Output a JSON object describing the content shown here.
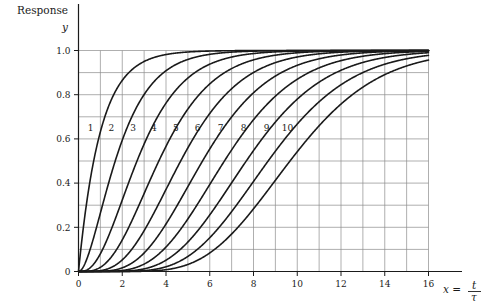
{
  "figure": {
    "y_axis_caption": "Response",
    "y_axis_symbol": "y",
    "x_axis_caption_lhs": "x =",
    "x_axis_caption_num": "t",
    "x_axis_caption_den": "τ"
  },
  "chart_data": {
    "type": "line",
    "title": "",
    "subtitle": "",
    "xlabel": "x = t/τ",
    "ylabel": "Response y",
    "xlim": [
      0,
      16
    ],
    "ylim": [
      0,
      1.04
    ],
    "grid": true,
    "grid_x_step": 1,
    "grid_y_step": 0.1,
    "legend": "inline-curve-labels",
    "legend_position": "inline",
    "xticks": [
      0,
      2,
      4,
      6,
      8,
      10,
      12,
      14,
      16
    ],
    "xtick_labels": [
      "0",
      "2",
      "4",
      "6",
      "8",
      "10",
      "12",
      "14",
      "16"
    ],
    "yticks": [
      0,
      0.2,
      0.4,
      0.6,
      0.8,
      1.0
    ],
    "ytick_labels": [
      "0",
      "0.2",
      "0.4",
      "0.6",
      "0.8",
      "1.0"
    ],
    "line_color": "#1a1a1a",
    "line_width": 1.6,
    "grid_color": "#8c8c8c",
    "axis_color": "#1a1a1a",
    "annotations": [
      {
        "text": "1",
        "x": 0.55,
        "y": 0.635
      },
      {
        "text": "2",
        "x": 1.5,
        "y": 0.635
      },
      {
        "text": "3",
        "x": 2.5,
        "y": 0.635
      },
      {
        "text": "4",
        "x": 3.45,
        "y": 0.635
      },
      {
        "text": "5",
        "x": 4.45,
        "y": 0.635
      },
      {
        "text": "6",
        "x": 5.45,
        "y": 0.635
      },
      {
        "text": "7",
        "x": 6.5,
        "y": 0.635
      },
      {
        "text": "8",
        "x": 7.55,
        "y": 0.635
      },
      {
        "text": "9",
        "x": 8.6,
        "y": 0.635
      },
      {
        "text": "10",
        "x": 9.55,
        "y": 0.635
      }
    ],
    "series": [
      {
        "name": "1",
        "order": 1,
        "formula": "y = 1 - e^{-x} * sum_{k=0}^{0} x^k/k!",
        "x": [
          0,
          0.25,
          0.5,
          0.75,
          1,
          1.5,
          2,
          2.5,
          3,
          4,
          5,
          6,
          7,
          8,
          10,
          12,
          14,
          16
        ],
        "values": [
          0,
          0.221,
          0.393,
          0.528,
          0.632,
          0.777,
          0.865,
          0.918,
          0.95,
          0.982,
          0.993,
          0.998,
          0.999,
          1.0,
          1.0,
          1.0,
          1.0,
          1.0
        ]
      },
      {
        "name": "2",
        "order": 2,
        "formula": "y = 1 - e^{-x}(1 + x)",
        "x": [
          0,
          0.5,
          1,
          1.5,
          2,
          2.5,
          3,
          4,
          5,
          6,
          7,
          8,
          10,
          12,
          14,
          16
        ],
        "values": [
          0,
          0.09,
          0.264,
          0.442,
          0.594,
          0.713,
          0.801,
          0.908,
          0.96,
          0.983,
          0.993,
          0.997,
          1.0,
          1.0,
          1.0,
          1.0
        ]
      },
      {
        "name": "3",
        "order": 3,
        "formula": "y = 1 - e^{-x}(1 + x + x^2/2)",
        "x": [
          0,
          0.5,
          1,
          1.5,
          2,
          2.5,
          3,
          4,
          5,
          6,
          7,
          8,
          10,
          12,
          14,
          16
        ],
        "values": [
          0,
          0.014,
          0.08,
          0.191,
          0.323,
          0.456,
          0.577,
          0.762,
          0.875,
          0.938,
          0.97,
          0.986,
          0.997,
          0.999,
          1.0,
          1.0
        ]
      },
      {
        "name": "4",
        "order": 4,
        "formula": "y = 1 - e^{-x} sum_{k=0}^{3} x^k/k!",
        "x": [
          0,
          1,
          1.5,
          2,
          2.5,
          3,
          3.5,
          4,
          5,
          6,
          7,
          8,
          10,
          12,
          14,
          16
        ],
        "values": [
          0,
          0.019,
          0.066,
          0.143,
          0.242,
          0.353,
          0.463,
          0.567,
          0.735,
          0.849,
          0.918,
          0.958,
          0.99,
          0.998,
          0.999,
          1.0
        ]
      },
      {
        "name": "5",
        "order": 5,
        "formula": "y = 1 - e^{-x} sum_{k=0}^{4} x^k/k!",
        "x": [
          0,
          1,
          2,
          2.5,
          3,
          3.5,
          4,
          4.5,
          5,
          6,
          7,
          8,
          10,
          12,
          14,
          16
        ],
        "values": [
          0,
          0.004,
          0.053,
          0.109,
          0.185,
          0.275,
          0.371,
          0.468,
          0.56,
          0.715,
          0.827,
          0.9,
          0.971,
          0.992,
          0.998,
          0.999
        ]
      },
      {
        "name": "6",
        "order": 6,
        "formula": "y = 1 - e^{-x} sum_{k=0}^{5} x^k/k!",
        "x": [
          0,
          1,
          2,
          3,
          3.5,
          4,
          4.5,
          5,
          5.5,
          6,
          7,
          8,
          10,
          12,
          14,
          16
        ],
        "values": [
          0,
          0.001,
          0.017,
          0.084,
          0.142,
          0.215,
          0.297,
          0.384,
          0.47,
          0.554,
          0.699,
          0.809,
          0.933,
          0.98,
          0.994,
          0.998
        ]
      },
      {
        "name": "7",
        "order": 7,
        "formula": "y = 1 - e^{-x} sum_{k=0}^{6} x^k/k!",
        "x": [
          0,
          2,
          3,
          4,
          4.5,
          5,
          5.5,
          6,
          6.5,
          7,
          8,
          9,
          10,
          12,
          14,
          16
        ],
        "values": [
          0,
          0.005,
          0.034,
          0.11,
          0.164,
          0.238,
          0.314,
          0.394,
          0.473,
          0.55,
          0.687,
          0.793,
          0.87,
          0.954,
          0.986,
          0.996
        ]
      },
      {
        "name": "8",
        "order": 8,
        "formula": "y = 1 - e^{-x} sum_{k=0}^{7} x^k/k!",
        "x": [
          0,
          2,
          3,
          4,
          5,
          5.5,
          6,
          6.5,
          7,
          7.5,
          8,
          9,
          10,
          12,
          14,
          16
        ],
        "values": [
          0,
          0.001,
          0.012,
          0.051,
          0.133,
          0.185,
          0.256,
          0.327,
          0.401,
          0.475,
          0.547,
          0.676,
          0.78,
          0.911,
          0.968,
          0.99
        ]
      },
      {
        "name": "9",
        "order": 9,
        "formula": "y = 1 - e^{-x} sum_{k=0}^{8} x^k/k!",
        "x": [
          0,
          3,
          4,
          5,
          6,
          6.5,
          7,
          7.5,
          8,
          8.5,
          9,
          10,
          11,
          12,
          14,
          16
        ],
        "values": [
          0,
          0.004,
          0.021,
          0.068,
          0.153,
          0.207,
          0.271,
          0.338,
          0.407,
          0.477,
          0.545,
          0.667,
          0.768,
          0.845,
          0.937,
          0.978
        ]
      },
      {
        "name": "10",
        "order": 10,
        "formula": "y = 1 - e^{-x} sum_{k=0}^{9} x^k/k!",
        "x": [
          0,
          4,
          5,
          6,
          7,
          7.5,
          8,
          8.5,
          9,
          9.5,
          10,
          11,
          12,
          13,
          14,
          16
        ],
        "values": [
          0,
          0.008,
          0.032,
          0.084,
          0.17,
          0.223,
          0.283,
          0.347,
          0.413,
          0.479,
          0.542,
          0.659,
          0.758,
          0.834,
          0.891,
          0.958
        ]
      }
    ]
  }
}
